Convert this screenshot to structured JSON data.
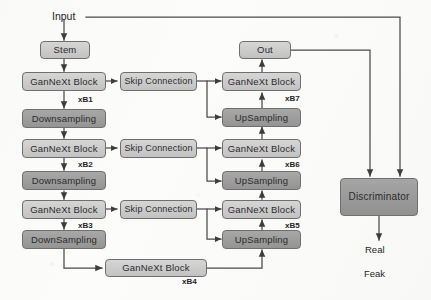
{
  "diagram": {
    "colors": {
      "page_background": "#fcfcfb",
      "block_light": "#cdcdcd",
      "block_dark": "#9d9d9d",
      "stroke": "#6f6f6f",
      "wire": "#4a4a4a",
      "text": "#2b2b2b"
    },
    "labels": {
      "input": "Input",
      "real": "Real",
      "fake": "Feak"
    },
    "encoder": {
      "stem": "Stem",
      "blocks": [
        {
          "name": "GanNeXt Block",
          "repeat": "xB1"
        },
        {
          "name": "GanNeXt Block",
          "repeat": "xB2"
        },
        {
          "name": "GanNeXt Block",
          "repeat": "xB3"
        }
      ],
      "downsampling": [
        "Downsampling",
        "Downsampling",
        "DownSampling"
      ]
    },
    "bottleneck": {
      "name": "GanNeXt Block",
      "repeat": "xB4"
    },
    "skips": [
      "Skip Connection",
      "Skip Connection",
      "Skip Connection"
    ],
    "decoder": {
      "out": "Out",
      "blocks": [
        {
          "name": "GanNeXt Block",
          "repeat": "xB7"
        },
        {
          "name": "GanNeXt Block",
          "repeat": "xB6"
        },
        {
          "name": "GanNeXt Block",
          "repeat": "xB5"
        }
      ],
      "upsampling": [
        "UpSampling",
        "UpSampling",
        "UpSampling"
      ]
    },
    "discriminator": {
      "name": "Discriminator"
    }
  }
}
